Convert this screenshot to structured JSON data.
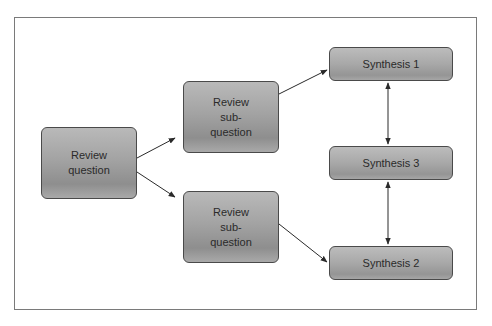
{
  "diagram": {
    "nodes": {
      "review_question": {
        "lines": [
          "Review",
          "question"
        ]
      },
      "sub_question_top": {
        "lines": [
          "Review",
          "sub-",
          "question"
        ]
      },
      "sub_question_bottom": {
        "lines": [
          "Review",
          "sub-",
          "question"
        ]
      },
      "synthesis_1": {
        "label": "Synthesis 1"
      },
      "synthesis_3": {
        "label": "Synthesis 3"
      },
      "synthesis_2": {
        "label": "Synthesis 2"
      }
    },
    "edges": [
      {
        "from": "review_question",
        "to": "sub_question_top",
        "type": "directed"
      },
      {
        "from": "review_question",
        "to": "sub_question_bottom",
        "type": "directed"
      },
      {
        "from": "sub_question_top",
        "to": "synthesis_1",
        "type": "directed"
      },
      {
        "from": "sub_question_bottom",
        "to": "synthesis_2",
        "type": "directed"
      },
      {
        "from": "synthesis_1",
        "to": "synthesis_3",
        "type": "bidirectional"
      },
      {
        "from": "synthesis_3",
        "to": "synthesis_2",
        "type": "bidirectional"
      }
    ],
    "colors": {
      "node_fill": "#a3a3a3",
      "node_border": "#4a4a4a",
      "edge": "#2a2a2a",
      "frame_border": "#7a7a7a"
    }
  }
}
